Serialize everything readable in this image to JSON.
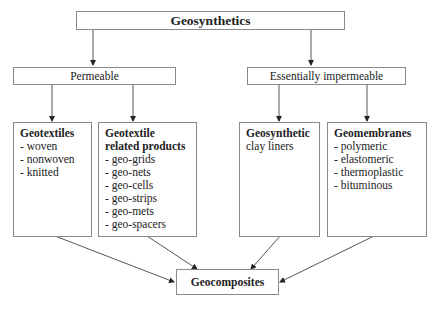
{
  "diagram": {
    "root": {
      "label": "Geosynthetics"
    },
    "groups": [
      {
        "label": "Permeable"
      },
      {
        "label": "Essentially impermeable"
      }
    ],
    "categories": [
      {
        "title": "Geotextiles",
        "subtitle": "",
        "items": [
          "- woven",
          "- nonwoven",
          "- knitted"
        ]
      },
      {
        "title": "Geotextile related products",
        "subtitle": "",
        "items": [
          "- geo-grids",
          "- geo-nets",
          "- geo-cells",
          "- geo-strips",
          "- geo-mets",
          "- geo-spacers"
        ]
      },
      {
        "title": "Geosynthetic",
        "subtitle": "clay liners",
        "items": []
      },
      {
        "title": "Geomembranes",
        "subtitle": "",
        "items": [
          "- polymeric",
          "- elastomeric",
          "- thermoplastic",
          "- bituminous"
        ]
      }
    ],
    "result": {
      "label": "Geocomposites"
    },
    "edges": [
      [
        "Geosynthetics",
        "Permeable"
      ],
      [
        "Geosynthetics",
        "Essentially impermeable"
      ],
      [
        "Permeable",
        "Geotextiles"
      ],
      [
        "Permeable",
        "Geotextile related products"
      ],
      [
        "Essentially impermeable",
        "Geosynthetic clay liners"
      ],
      [
        "Essentially impermeable",
        "Geomembranes"
      ],
      [
        "Geotextiles",
        "Geocomposites"
      ],
      [
        "Geotextile related products",
        "Geocomposites"
      ],
      [
        "Geosynthetic clay liners",
        "Geocomposites"
      ],
      [
        "Geomembranes",
        "Geocomposites"
      ]
    ]
  }
}
